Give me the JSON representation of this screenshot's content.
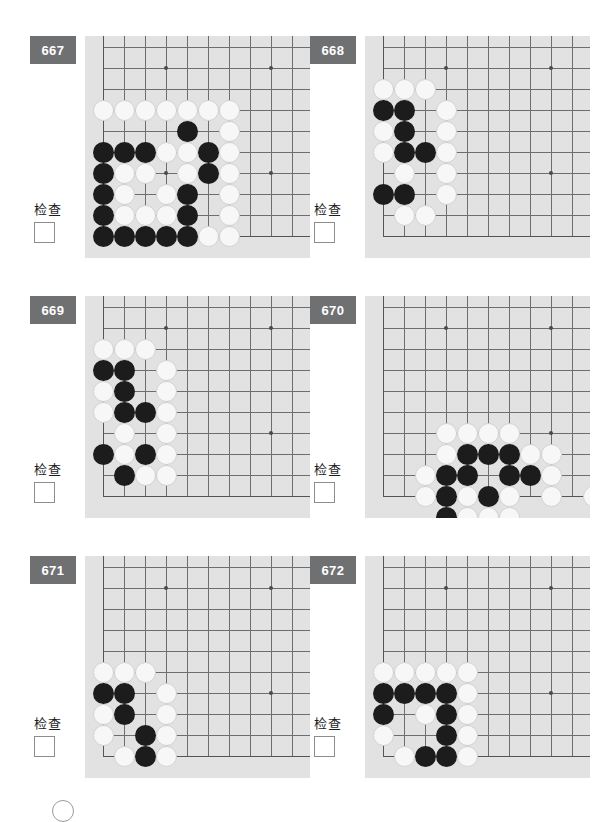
{
  "page": {
    "check_label": "检查",
    "badge_color": "#6f7072",
    "board_bg": "#e2e2e2",
    "black_color": "#1c1c1c",
    "white_color": "#f7f7f7",
    "grid_color": "#6d6d6d"
  },
  "board_spec": {
    "cols": 10,
    "rows": 10,
    "spacing": 21,
    "origin_x": 18,
    "origin_y": 11,
    "stone_diameter": 21
  },
  "problems": [
    {
      "id": "667",
      "number": "667",
      "check_label": "检查",
      "checked": false,
      "board": {
        "edges": {
          "left": true,
          "bottom": true,
          "top": false,
          "right": false
        },
        "left_edge_col": 0,
        "bottom_edge_row": 9,
        "star_points": [
          [
            3,
            1
          ],
          [
            8,
            1
          ],
          [
            3,
            6
          ],
          [
            8,
            6
          ]
        ],
        "stones": [
          {
            "c": 0,
            "r": 3,
            "color": "w"
          },
          {
            "c": 1,
            "r": 3,
            "color": "w"
          },
          {
            "c": 2,
            "r": 3,
            "color": "w"
          },
          {
            "c": 3,
            "r": 3,
            "color": "w"
          },
          {
            "c": 4,
            "r": 3,
            "color": "w"
          },
          {
            "c": 5,
            "r": 3,
            "color": "w"
          },
          {
            "c": 6,
            "r": 3,
            "color": "w"
          },
          {
            "c": 4,
            "r": 4,
            "color": "b"
          },
          {
            "c": 6,
            "r": 4,
            "color": "w"
          },
          {
            "c": 0,
            "r": 5,
            "color": "b"
          },
          {
            "c": 1,
            "r": 5,
            "color": "b"
          },
          {
            "c": 2,
            "r": 5,
            "color": "b"
          },
          {
            "c": 3,
            "r": 5,
            "color": "w"
          },
          {
            "c": 4,
            "r": 5,
            "color": "w"
          },
          {
            "c": 5,
            "r": 5,
            "color": "b"
          },
          {
            "c": 6,
            "r": 5,
            "color": "w"
          },
          {
            "c": 0,
            "r": 6,
            "color": "b"
          },
          {
            "c": 1,
            "r": 6,
            "color": "w"
          },
          {
            "c": 2,
            "r": 6,
            "color": "w"
          },
          {
            "c": 4,
            "r": 6,
            "color": "w"
          },
          {
            "c": 5,
            "r": 6,
            "color": "b"
          },
          {
            "c": 6,
            "r": 6,
            "color": "w"
          },
          {
            "c": 0,
            "r": 7,
            "color": "b"
          },
          {
            "c": 1,
            "r": 7,
            "color": "w"
          },
          {
            "c": 3,
            "r": 7,
            "color": "w"
          },
          {
            "c": 4,
            "r": 7,
            "color": "b"
          },
          {
            "c": 6,
            "r": 7,
            "color": "w"
          },
          {
            "c": 0,
            "r": 8,
            "color": "b"
          },
          {
            "c": 1,
            "r": 8,
            "color": "w"
          },
          {
            "c": 2,
            "r": 8,
            "color": "w"
          },
          {
            "c": 3,
            "r": 8,
            "color": "w"
          },
          {
            "c": 4,
            "r": 8,
            "color": "b"
          },
          {
            "c": 6,
            "r": 8,
            "color": "w"
          },
          {
            "c": 0,
            "r": 9,
            "color": "b"
          },
          {
            "c": 1,
            "r": 9,
            "color": "b"
          },
          {
            "c": 2,
            "r": 9,
            "color": "b"
          },
          {
            "c": 3,
            "r": 9,
            "color": "b"
          },
          {
            "c": 4,
            "r": 9,
            "color": "b"
          },
          {
            "c": 5,
            "r": 9,
            "color": "w"
          },
          {
            "c": 6,
            "r": 9,
            "color": "w"
          }
        ]
      }
    },
    {
      "id": "668",
      "number": "668",
      "check_label": "检查",
      "checked": false,
      "board": {
        "edges": {
          "left": true,
          "bottom": true,
          "top": false,
          "right": false
        },
        "left_edge_col": 0,
        "bottom_edge_row": 9,
        "star_points": [
          [
            3,
            1
          ],
          [
            8,
            1
          ],
          [
            3,
            6
          ],
          [
            8,
            6
          ]
        ],
        "stones": [
          {
            "c": 0,
            "r": 2,
            "color": "w"
          },
          {
            "c": 1,
            "r": 2,
            "color": "w"
          },
          {
            "c": 2,
            "r": 2,
            "color": "w"
          },
          {
            "c": 0,
            "r": 3,
            "color": "b"
          },
          {
            "c": 1,
            "r": 3,
            "color": "b"
          },
          {
            "c": 3,
            "r": 3,
            "color": "w"
          },
          {
            "c": 0,
            "r": 4,
            "color": "w"
          },
          {
            "c": 1,
            "r": 4,
            "color": "b"
          },
          {
            "c": 3,
            "r": 4,
            "color": "w"
          },
          {
            "c": 0,
            "r": 5,
            "color": "w"
          },
          {
            "c": 1,
            "r": 5,
            "color": "b"
          },
          {
            "c": 2,
            "r": 5,
            "color": "b"
          },
          {
            "c": 3,
            "r": 5,
            "color": "w"
          },
          {
            "c": 1,
            "r": 6,
            "color": "w"
          },
          {
            "c": 3,
            "r": 6,
            "color": "w"
          },
          {
            "c": 0,
            "r": 7,
            "color": "b"
          },
          {
            "c": 1,
            "r": 7,
            "color": "b"
          },
          {
            "c": 3,
            "r": 7,
            "color": "w"
          },
          {
            "c": 1,
            "r": 8,
            "color": "w"
          },
          {
            "c": 2,
            "r": 8,
            "color": "w"
          }
        ]
      }
    },
    {
      "id": "669",
      "number": "669",
      "check_label": "检查",
      "checked": false,
      "board": {
        "edges": {
          "left": true,
          "bottom": true,
          "top": false,
          "right": false
        },
        "left_edge_col": 0,
        "bottom_edge_row": 9,
        "star_points": [
          [
            3,
            1
          ],
          [
            8,
            1
          ],
          [
            3,
            6
          ],
          [
            8,
            6
          ]
        ],
        "stones": [
          {
            "c": 0,
            "r": 2,
            "color": "w"
          },
          {
            "c": 1,
            "r": 2,
            "color": "w"
          },
          {
            "c": 2,
            "r": 2,
            "color": "w"
          },
          {
            "c": 0,
            "r": 3,
            "color": "b"
          },
          {
            "c": 1,
            "r": 3,
            "color": "b"
          },
          {
            "c": 3,
            "r": 3,
            "color": "w"
          },
          {
            "c": 0,
            "r": 4,
            "color": "w"
          },
          {
            "c": 1,
            "r": 4,
            "color": "b"
          },
          {
            "c": 3,
            "r": 4,
            "color": "w"
          },
          {
            "c": 0,
            "r": 5,
            "color": "w"
          },
          {
            "c": 1,
            "r": 5,
            "color": "b"
          },
          {
            "c": 2,
            "r": 5,
            "color": "b"
          },
          {
            "c": 3,
            "r": 5,
            "color": "w"
          },
          {
            "c": 1,
            "r": 6,
            "color": "w"
          },
          {
            "c": 3,
            "r": 6,
            "color": "w"
          },
          {
            "c": 0,
            "r": 7,
            "color": "b"
          },
          {
            "c": 1,
            "r": 7,
            "color": "w"
          },
          {
            "c": 2,
            "r": 7,
            "color": "b"
          },
          {
            "c": 3,
            "r": 7,
            "color": "w"
          },
          {
            "c": 1,
            "r": 8,
            "color": "b"
          },
          {
            "c": 2,
            "r": 8,
            "color": "w"
          },
          {
            "c": 3,
            "r": 8,
            "color": "w"
          }
        ]
      }
    },
    {
      "id": "670",
      "number": "670",
      "check_label": "检查",
      "checked": false,
      "board": {
        "edges": {
          "left": true,
          "bottom": true,
          "top": false,
          "right": false
        },
        "left_edge_col": 0,
        "bottom_edge_row": 9,
        "star_points": [
          [
            3,
            1
          ],
          [
            8,
            1
          ],
          [
            3,
            6
          ],
          [
            8,
            6
          ]
        ],
        "stones": [
          {
            "c": 3,
            "r": 6,
            "color": "w"
          },
          {
            "c": 4,
            "r": 6,
            "color": "w"
          },
          {
            "c": 5,
            "r": 6,
            "color": "w"
          },
          {
            "c": 6,
            "r": 6,
            "color": "w"
          },
          {
            "c": 3,
            "r": 7,
            "color": "w"
          },
          {
            "c": 4,
            "r": 7,
            "color": "b"
          },
          {
            "c": 5,
            "r": 7,
            "color": "b"
          },
          {
            "c": 6,
            "r": 7,
            "color": "b"
          },
          {
            "c": 7,
            "r": 7,
            "color": "w"
          },
          {
            "c": 8,
            "r": 7,
            "color": "w"
          },
          {
            "c": 2,
            "r": 8,
            "color": "w"
          },
          {
            "c": 3,
            "r": 8,
            "color": "b"
          },
          {
            "c": 4,
            "r": 8,
            "color": "b"
          },
          {
            "c": 6,
            "r": 8,
            "color": "b"
          },
          {
            "c": 7,
            "r": 8,
            "color": "b"
          },
          {
            "c": 8,
            "r": 8,
            "color": "w"
          },
          {
            "c": 2,
            "r": 9,
            "color": "w"
          },
          {
            "c": 3,
            "r": 9,
            "color": "b"
          },
          {
            "c": 4,
            "r": 9,
            "color": "w"
          },
          {
            "c": 5,
            "r": 9,
            "color": "b"
          },
          {
            "c": 6,
            "r": 9,
            "color": "w"
          },
          {
            "c": 8,
            "r": 9,
            "color": "w"
          },
          {
            "c": 10,
            "r": 9,
            "color": "w"
          },
          {
            "c": 3,
            "r": 10,
            "color": "b"
          },
          {
            "c": 4,
            "r": 10,
            "color": "w"
          },
          {
            "c": 5,
            "r": 10,
            "color": "w"
          },
          {
            "c": 6,
            "r": 10,
            "color": "w"
          }
        ]
      }
    },
    {
      "id": "671",
      "number": "671",
      "check_label": "检查",
      "checked": false,
      "board": {
        "edges": {
          "left": true,
          "bottom": true,
          "top": false,
          "right": false
        },
        "left_edge_col": 0,
        "bottom_edge_row": 9,
        "star_points": [
          [
            3,
            1
          ],
          [
            8,
            1
          ],
          [
            3,
            6
          ],
          [
            8,
            6
          ]
        ],
        "stones": [
          {
            "c": 0,
            "r": 5,
            "color": "w"
          },
          {
            "c": 1,
            "r": 5,
            "color": "w"
          },
          {
            "c": 2,
            "r": 5,
            "color": "w"
          },
          {
            "c": 0,
            "r": 6,
            "color": "b"
          },
          {
            "c": 1,
            "r": 6,
            "color": "b"
          },
          {
            "c": 3,
            "r": 6,
            "color": "w"
          },
          {
            "c": 0,
            "r": 7,
            "color": "w"
          },
          {
            "c": 1,
            "r": 7,
            "color": "b"
          },
          {
            "c": 3,
            "r": 7,
            "color": "w"
          },
          {
            "c": 0,
            "r": 8,
            "color": "w"
          },
          {
            "c": 2,
            "r": 8,
            "color": "b"
          },
          {
            "c": 3,
            "r": 8,
            "color": "w"
          },
          {
            "c": 1,
            "r": 9,
            "color": "w"
          },
          {
            "c": 2,
            "r": 9,
            "color": "b"
          },
          {
            "c": 3,
            "r": 9,
            "color": "w"
          }
        ]
      }
    },
    {
      "id": "672",
      "number": "672",
      "check_label": "检查",
      "checked": false,
      "board": {
        "edges": {
          "left": true,
          "bottom": true,
          "top": false,
          "right": false
        },
        "left_edge_col": 0,
        "bottom_edge_row": 9,
        "star_points": [
          [
            3,
            1
          ],
          [
            8,
            1
          ],
          [
            3,
            6
          ],
          [
            8,
            6
          ]
        ],
        "stones": [
          {
            "c": 0,
            "r": 5,
            "color": "w"
          },
          {
            "c": 1,
            "r": 5,
            "color": "w"
          },
          {
            "c": 2,
            "r": 5,
            "color": "w"
          },
          {
            "c": 3,
            "r": 5,
            "color": "w"
          },
          {
            "c": 4,
            "r": 5,
            "color": "w"
          },
          {
            "c": 0,
            "r": 6,
            "color": "b"
          },
          {
            "c": 1,
            "r": 6,
            "color": "b"
          },
          {
            "c": 2,
            "r": 6,
            "color": "b"
          },
          {
            "c": 3,
            "r": 6,
            "color": "b"
          },
          {
            "c": 4,
            "r": 6,
            "color": "w"
          },
          {
            "c": 0,
            "r": 7,
            "color": "b"
          },
          {
            "c": 2,
            "r": 7,
            "color": "w"
          },
          {
            "c": 3,
            "r": 7,
            "color": "b"
          },
          {
            "c": 4,
            "r": 7,
            "color": "w"
          },
          {
            "c": 0,
            "r": 8,
            "color": "w"
          },
          {
            "c": 3,
            "r": 8,
            "color": "b"
          },
          {
            "c": 4,
            "r": 8,
            "color": "w"
          },
          {
            "c": 1,
            "r": 9,
            "color": "w"
          },
          {
            "c": 2,
            "r": 9,
            "color": "b"
          },
          {
            "c": 3,
            "r": 9,
            "color": "b"
          },
          {
            "c": 4,
            "r": 9,
            "color": "w"
          }
        ]
      }
    }
  ]
}
